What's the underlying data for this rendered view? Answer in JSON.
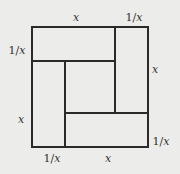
{
  "diagram": {
    "labels": {
      "top_x": "x",
      "top_inv": "1/x",
      "left_inv": "1/x",
      "right_x": "x",
      "left_x": "x",
      "right_inv": "1/x",
      "bottom_inv": "1/x",
      "bottom_x": "x"
    },
    "colors": {
      "background": "#ececea",
      "stroke": "#2a2a2a",
      "text": "#333333"
    }
  }
}
